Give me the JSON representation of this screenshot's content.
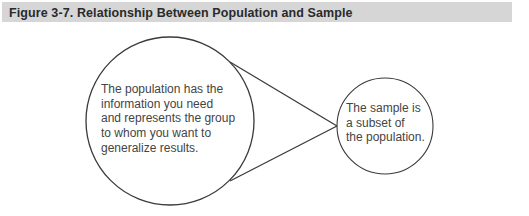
{
  "figure": {
    "title": "Figure 3-7. Relationship Between Population and Sample"
  },
  "population_circle": {
    "lines": [
      "The population has the",
      "information you need",
      "and represents the group",
      "to whom you want to",
      "generalize results."
    ]
  },
  "sample_circle": {
    "lines": [
      "The sample is",
      "a subset of",
      "the population."
    ]
  },
  "colors": {
    "header_background": "#d6d6d6",
    "stroke": "#3a3a3a",
    "text": "#444444"
  }
}
